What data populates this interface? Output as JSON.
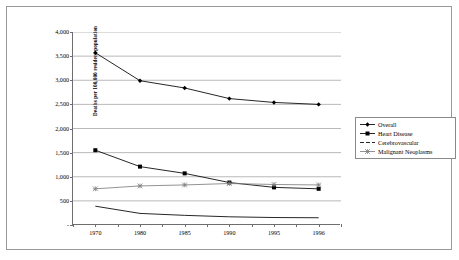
{
  "chart_data": {
    "type": "line",
    "title": "",
    "xlabel": "",
    "ylabel": "Deaths per 100,000 resident population",
    "categories": [
      "1970",
      "1980",
      "1985",
      "1990",
      "1995",
      "1996"
    ],
    "ylim": [
      0,
      4000
    ],
    "y_ticks": [
      0,
      500,
      1000,
      1500,
      2000,
      2500,
      3000,
      3500,
      4000
    ],
    "y_tick_labels": [
      "-",
      "500",
      "1,000",
      "1,500",
      "2,000",
      "2,500",
      "3,000",
      "3,500",
      "4,000"
    ],
    "grid": true,
    "legend_position": "right",
    "series": [
      {
        "name": "Overall",
        "marker": "diamond",
        "color": "#000000",
        "values": [
          3570,
          2990,
          2840,
          2620,
          2540,
          2500
        ]
      },
      {
        "name": "Heart Disease",
        "marker": "square",
        "color": "#000000",
        "values": [
          1550,
          1210,
          1070,
          880,
          780,
          750
        ]
      },
      {
        "name": "Cerebrovascular",
        "marker": "none",
        "color": "#000000",
        "values": [
          390,
          240,
          200,
          170,
          155,
          150
        ]
      },
      {
        "name": "Malignant Neoplasms",
        "marker": "star",
        "color": "#808080",
        "values": [
          750,
          810,
          830,
          860,
          840,
          830
        ]
      }
    ]
  },
  "axis": {
    "y_title": "Deaths per 100,000 resident population"
  },
  "legend": {
    "entries": [
      {
        "label": "Overall"
      },
      {
        "label": "Heart Disease"
      },
      {
        "label": "Cerebrovascular"
      },
      {
        "label": "Malignant Neoplasms"
      }
    ]
  }
}
